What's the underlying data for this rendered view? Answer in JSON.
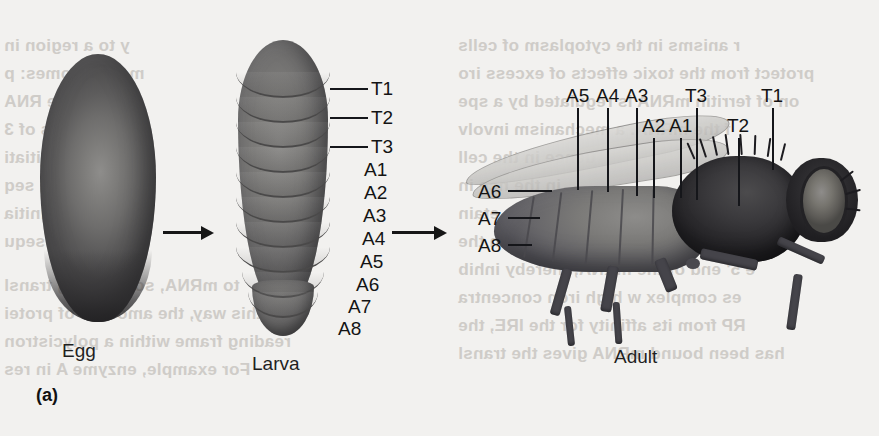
{
  "figure": {
    "panel_letter": "(a)",
    "stages": [
      {
        "name": "egg",
        "caption": "Egg"
      },
      {
        "name": "larva",
        "caption": "Larva"
      },
      {
        "name": "adult",
        "caption": "Adult"
      }
    ],
    "larva_labels": [
      {
        "text": "T1",
        "leader": true
      },
      {
        "text": "T2",
        "leader": true
      },
      {
        "text": "T3",
        "leader": true
      },
      {
        "text": "A1",
        "leader": false
      },
      {
        "text": "A2",
        "leader": false
      },
      {
        "text": "A3",
        "leader": false
      },
      {
        "text": "A4",
        "leader": false
      },
      {
        "text": "A5",
        "leader": false
      },
      {
        "text": "A6",
        "leader": false
      },
      {
        "text": "A7",
        "leader": false
      },
      {
        "text": "A8",
        "leader": false
      }
    ],
    "adult_labels_top": [
      {
        "text": "A5"
      },
      {
        "text": "A4"
      },
      {
        "text": "A3"
      },
      {
        "text": "T3"
      },
      {
        "text": "T1"
      }
    ],
    "adult_labels_lower": [
      {
        "text": "A2"
      },
      {
        "text": "A1"
      },
      {
        "text": "T2"
      }
    ],
    "adult_labels_left": [
      {
        "text": "A6"
      },
      {
        "text": "A7"
      },
      {
        "text": "A8"
      }
    ],
    "arrows": [
      {
        "name": "egg-to-larva"
      },
      {
        "name": "larva-to-adult"
      }
    ],
    "bleed_text": [
      "y to a region in",
      "me ribosomes: p",
      "uence     RNA",
      "s of 3",
      "initiati",
      "ng seq",
      "initia",
      "no sequ",
      "to mRNA, so meaning transl",
      "In this way, the amounts of protei",
      "reading frame within a polycistron",
      "For example, enzyme A in res",
      "r anisms in the cytoplasm of cells",
      "protect from the toxic effects of excess iro",
      "on of ferritin mRNA is regulated by a spe",
      "f the mRNA.  a mechanism involv",
      "uence in the cell",
      "in the     nce in",
      "ing th     etain",
      "ntly physically interferes with the",
      "e 5' end of the mRNA, thereby inhib",
      "es complex    w high iron concentra",
      "RP from its affinity for the IRE, the",
      "has been bound mRNA gives the transl"
    ]
  }
}
